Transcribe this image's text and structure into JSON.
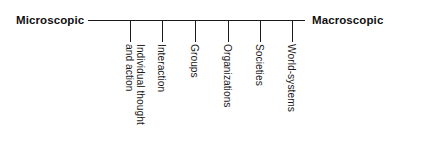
{
  "figure": {
    "axis": {
      "left_label": "Microscopic",
      "right_label": "Macroscopic",
      "line_color": "#1a1a1a"
    },
    "levels": [
      {
        "label_line1": "Individual thought",
        "label_line2": "and action",
        "tick_x": 130
      },
      {
        "label_line1": "Interaction",
        "label_line2": "",
        "tick_x": 162
      },
      {
        "label_line1": "Groups",
        "label_line2": "",
        "tick_x": 195
      },
      {
        "label_line1": "Organizations",
        "label_line2": "",
        "tick_x": 228
      },
      {
        "label_line1": "Societies",
        "label_line2": "",
        "tick_x": 260
      },
      {
        "label_line1": "World-systems",
        "label_line2": "",
        "tick_x": 292
      }
    ]
  },
  "chart_data": {
    "type": "line",
    "title": "",
    "xlabel": "",
    "ylabel": "",
    "categories": [
      "Individual thought and action",
      "Interaction",
      "Groups",
      "Organizations",
      "Societies",
      "World-systems"
    ],
    "values": [
      1,
      2,
      3,
      4,
      5,
      6
    ],
    "axis_endpoints": [
      "Microscopic",
      "Macroscopic"
    ],
    "grid": false,
    "legend": "none"
  }
}
